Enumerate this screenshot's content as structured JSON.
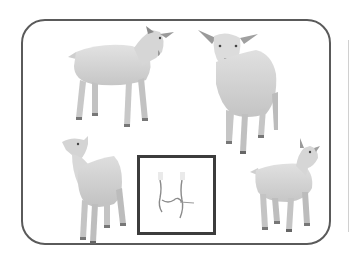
{
  "scene": {
    "description": "Four goat kids arranged around a rounded frame with a small boxed tracing of goat legs in the center",
    "frame_color": "#5a5a5a",
    "box_border_color": "#3c3c3c",
    "goat_fill": "#d9d9d9",
    "goat_shade": "#bdbdbd",
    "goat_dark": "#8a8a8a"
  },
  "goats": [
    {
      "id": "goat-top-left",
      "pose": "standing, facing right, head turned toward viewer"
    },
    {
      "id": "goat-top-right",
      "pose": "standing, facing viewer"
    },
    {
      "id": "goat-bottom-left",
      "pose": "standing, head raised looking up-left"
    },
    {
      "id": "goat-bottom-right",
      "pose": "standing, facing right, head turned"
    }
  ],
  "center_box": {
    "content": "sketch of goat legs"
  }
}
